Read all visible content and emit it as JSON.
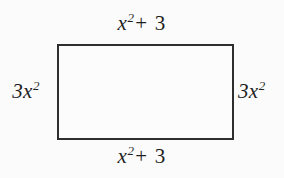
{
  "figure": {
    "type": "geometry-diagram",
    "shape": "rectangle",
    "colors": {
      "background": "#fbfbfb",
      "shape_fill": "#fcfcfc",
      "shape_stroke": "#2e2e2e",
      "label_text": "#1f1f1f"
    },
    "labels": {
      "top": {
        "base": "x",
        "exponent": "2",
        "operator": "+",
        "constant": "3",
        "full": "x² + 3"
      },
      "bottom": {
        "base": "x",
        "exponent": "2",
        "operator": "+",
        "constant": "3",
        "full": "x² + 3"
      },
      "left": {
        "coefficient": "3",
        "base": "x",
        "exponent": "2",
        "full": "3x²"
      },
      "right": {
        "coefficient": "3",
        "base": "x",
        "exponent": "2",
        "full": "3x²"
      }
    }
  }
}
